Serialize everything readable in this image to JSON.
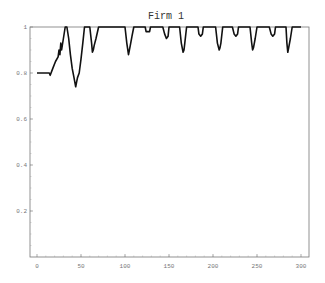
{
  "chart_data": {
    "type": "line",
    "title": "Firm 1",
    "xlabel": "",
    "ylabel": "",
    "xlim": [
      0,
      300
    ],
    "ylim": [
      0,
      1
    ],
    "xticks": [
      0,
      50,
      100,
      150,
      200,
      250,
      300
    ],
    "yticks": [
      0.2,
      0.4,
      0.6,
      0.8,
      1
    ],
    "ytick_labels": [
      "0.2",
      "0.4",
      "0.6",
      "0.8",
      "1"
    ],
    "xtick_labels": [
      "0",
      "50",
      "100",
      "150",
      "200",
      "250",
      "300"
    ],
    "grid": false,
    "legend": null,
    "series": [
      {
        "name": "Firm 1",
        "color": "#111111",
        "x": [
          0,
          10,
          14,
          15,
          18,
          21,
          24,
          25,
          26,
          27,
          28,
          30,
          32,
          34,
          36,
          38,
          40,
          42,
          44,
          45,
          46,
          48,
          50,
          52,
          54,
          60,
          62,
          63,
          64,
          65,
          67,
          70,
          100,
          102,
          104,
          105,
          106,
          108,
          110,
          123,
          124,
          126,
          128,
          129,
          143,
          145,
          147,
          149,
          150,
          162,
          164,
          166,
          167,
          168,
          170,
          183,
          184,
          186,
          188,
          189,
          203,
          205,
          207,
          208,
          209,
          211,
          222,
          224,
          226,
          228,
          229,
          242,
          244,
          245,
          246,
          248,
          250,
          264,
          266,
          268,
          270,
          271,
          283,
          284,
          285,
          286,
          288,
          290,
          300
        ],
        "y": [
          0.8,
          0.8,
          0.8,
          0.79,
          0.82,
          0.85,
          0.87,
          0.9,
          0.88,
          0.93,
          0.9,
          0.95,
          1.0,
          1.0,
          0.95,
          0.88,
          0.82,
          0.78,
          0.74,
          0.76,
          0.78,
          0.8,
          0.86,
          0.93,
          1.0,
          1.0,
          0.93,
          0.89,
          0.9,
          0.92,
          0.95,
          1.0,
          1.0,
          0.93,
          0.88,
          0.9,
          0.92,
          0.96,
          1.0,
          1.0,
          0.98,
          0.98,
          0.98,
          1.0,
          1.0,
          0.97,
          0.95,
          0.96,
          1.0,
          1.0,
          0.93,
          0.89,
          0.9,
          0.93,
          1.0,
          1.0,
          0.97,
          0.96,
          0.97,
          1.0,
          1.0,
          0.93,
          0.9,
          0.91,
          0.93,
          1.0,
          1.0,
          0.97,
          0.96,
          0.97,
          1.0,
          1.0,
          0.93,
          0.9,
          0.91,
          0.95,
          1.0,
          1.0,
          0.97,
          0.96,
          0.97,
          1.0,
          1.0,
          0.93,
          0.89,
          0.91,
          0.95,
          1.0,
          1.0
        ]
      }
    ]
  },
  "plot": {
    "left": 30,
    "right": 309,
    "top": 27,
    "bottom": 257,
    "x0_px": 37,
    "x300_px": 301
  }
}
